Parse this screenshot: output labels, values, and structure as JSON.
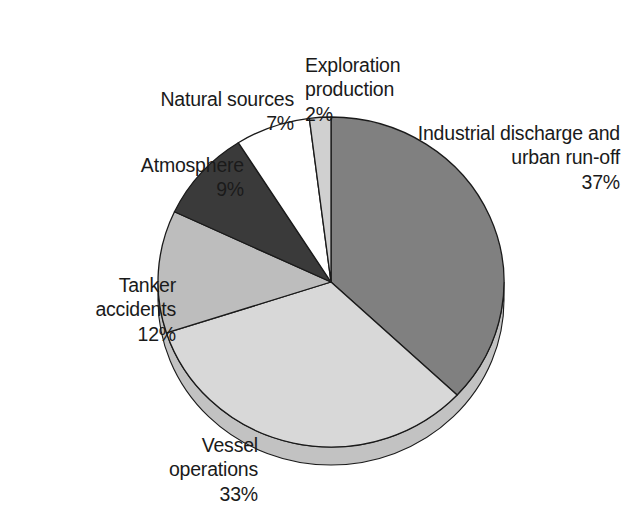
{
  "chart_data": {
    "type": "pie",
    "title": "",
    "subtitle": "",
    "xlabel": "",
    "ylabel": "",
    "legend_position": "none",
    "grid": false,
    "units": "percent",
    "start_angle_deg": 0,
    "direction": "clockwise",
    "categories": [
      "Industrial discharge and urban run-off",
      "Vessel operations",
      "Tanker accidents",
      "Atmosphere",
      "Natural sources",
      "Exploration production"
    ],
    "values": [
      37,
      33,
      12,
      9,
      7,
      2
    ],
    "colors": [
      "#808080",
      "#d8d8d8",
      "#bdbdbd",
      "#3a3a3a",
      "#ffffff",
      "#d0d0d0"
    ],
    "slices": [
      {
        "name": "Industrial discharge and urban run-off",
        "value": 37,
        "percent_text": "37%",
        "color": "#808080",
        "start_deg": 0,
        "end_deg": 133.2
      },
      {
        "name": "Vessel operations",
        "value": 33,
        "percent_text": "33%",
        "color": "#d8d8d8",
        "start_deg": 133.2,
        "end_deg": 252.0
      },
      {
        "name": "Tanker accidents",
        "value": 12,
        "percent_text": "12%",
        "color": "#bdbdbd",
        "start_deg": 252.0,
        "end_deg": 295.2
      },
      {
        "name": "Atmosphere",
        "value": 9,
        "percent_text": "9%",
        "color": "#3a3a3a",
        "start_deg": 295.2,
        "end_deg": 327.6
      },
      {
        "name": "Natural sources",
        "value": 7,
        "percent_text": "7%",
        "color": "#ffffff",
        "start_deg": 327.6,
        "end_deg": 352.8
      },
      {
        "name": "Exploration production",
        "value": 2,
        "percent_text": "2%",
        "color": "#d0d0d0",
        "start_deg": 352.8,
        "end_deg": 360.0
      }
    ]
  },
  "labels": {
    "exploration": {
      "name": "Exploration\nproduction",
      "percent": "2%"
    },
    "industrial": {
      "name": "Industrial discharge and\nurban run-off",
      "percent": "37%"
    },
    "natural": {
      "name": "Natural sources",
      "percent": "7%"
    },
    "atmosphere": {
      "name": "Atmosphere",
      "percent": "9%"
    },
    "tanker": {
      "name": "Tanker\naccidents",
      "percent": "12%"
    },
    "vessel": {
      "name": "Vessel\noperations",
      "percent": "33%"
    }
  },
  "style": {
    "outline_color": "#1a1a1a",
    "text_color": "#1a1a1a",
    "background": "#ffffff",
    "shadow_color": "#c2c2c2"
  }
}
